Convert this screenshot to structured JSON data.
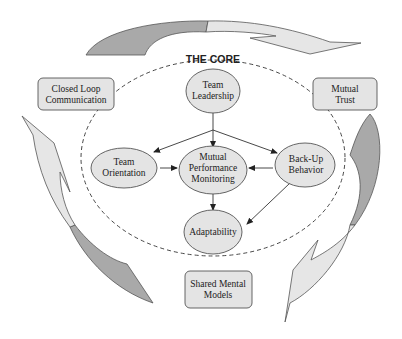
{
  "diagram": {
    "title": "THE CORE",
    "colors": {
      "node_fill": "#e4e4e4",
      "node_stroke": "#555555",
      "arrow_light": "#e6e6e6",
      "arrow_dark": "#a9a9a9",
      "dashed_boundary": "#333333",
      "text": "#222222"
    },
    "core_nodes": {
      "team_leadership": {
        "line1": "Team",
        "line2": "Leadership"
      },
      "team_orientation": {
        "line1": "Team",
        "line2": "Orientation"
      },
      "mutual_performance_monitoring": {
        "line1": "Mutual",
        "line2": "Performance",
        "line3": "Monitoring"
      },
      "backup_behavior": {
        "line1": "Back-Up",
        "line2": "Behavior"
      },
      "adaptability": {
        "line1": "Adaptability"
      }
    },
    "coordinating_mechanisms": {
      "closed_loop_communication": {
        "line1": "Closed Loop",
        "line2": "Communication"
      },
      "mutual_trust": {
        "line1": "Mutual",
        "line2": "Trust"
      },
      "shared_mental_models": {
        "line1": "Shared Mental",
        "line2": "Models"
      }
    },
    "edges": [
      {
        "from": "Team Leadership",
        "to": "Team Orientation"
      },
      {
        "from": "Team Leadership",
        "to": "Mutual Performance Monitoring"
      },
      {
        "from": "Team Leadership",
        "to": "Back-Up Behavior"
      },
      {
        "from": "Team Orientation",
        "to": "Mutual Performance Monitoring"
      },
      {
        "from": "Back-Up Behavior",
        "to": "Mutual Performance Monitoring"
      },
      {
        "from": "Mutual Performance Monitoring",
        "to": "Adaptability"
      },
      {
        "from": "Back-Up Behavior",
        "to": "Adaptability"
      }
    ],
    "cycle_arrows": [
      {
        "name": "top",
        "direction": "Closed Loop Communication to Mutual Trust"
      },
      {
        "name": "right",
        "direction": "Mutual Trust to Shared Mental Models"
      },
      {
        "name": "left",
        "direction": "Shared Mental Models to Closed Loop Communication"
      }
    ]
  }
}
